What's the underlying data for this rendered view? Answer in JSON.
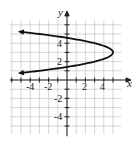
{
  "chart_data": {
    "type": "line",
    "title": "",
    "xlabel": "x",
    "ylabel": "y",
    "xlim": [
      -6.2,
      5.9
    ],
    "ylim": [
      -5.9,
      6.5
    ],
    "grid": true,
    "x_ticks": [
      -4,
      -2,
      2,
      4
    ],
    "y_ticks": [
      4,
      2,
      -2,
      -4
    ],
    "x_tick_labels": [
      "-4",
      "-2",
      "2",
      "4"
    ],
    "y_tick_labels": [
      "4",
      "2",
      "-2",
      "-4"
    ],
    "series": [
      {
        "name": "parabola",
        "equation": "x = 5 - 2(y - 3)^2",
        "vertex": [
          5,
          3
        ],
        "opens": "left",
        "arrows_at_ends": true,
        "points": [
          [
            -5,
            5.24
          ],
          [
            -4,
            5.12
          ],
          [
            -3,
            5.0
          ],
          [
            -2,
            4.87
          ],
          [
            -1,
            4.73
          ],
          [
            0,
            4.58
          ],
          [
            1,
            4.41
          ],
          [
            2,
            4.22
          ],
          [
            3,
            4.0
          ],
          [
            4,
            3.71
          ],
          [
            4.5,
            3.5
          ],
          [
            5,
            3
          ],
          [
            4.5,
            2.5
          ],
          [
            4,
            2.29
          ],
          [
            3,
            2.0
          ],
          [
            2,
            1.78
          ],
          [
            1,
            1.59
          ],
          [
            0,
            1.42
          ],
          [
            -1,
            1.27
          ],
          [
            -2,
            1.13
          ],
          [
            -3,
            1.0
          ],
          [
            -4,
            0.88
          ],
          [
            -5,
            0.76
          ]
        ]
      }
    ]
  },
  "labels": {
    "x_axis": "x",
    "y_axis": "y",
    "xt": [
      "-4",
      "-2",
      "2",
      "4"
    ],
    "yt": [
      "4",
      "2",
      "-2",
      "-4"
    ]
  }
}
